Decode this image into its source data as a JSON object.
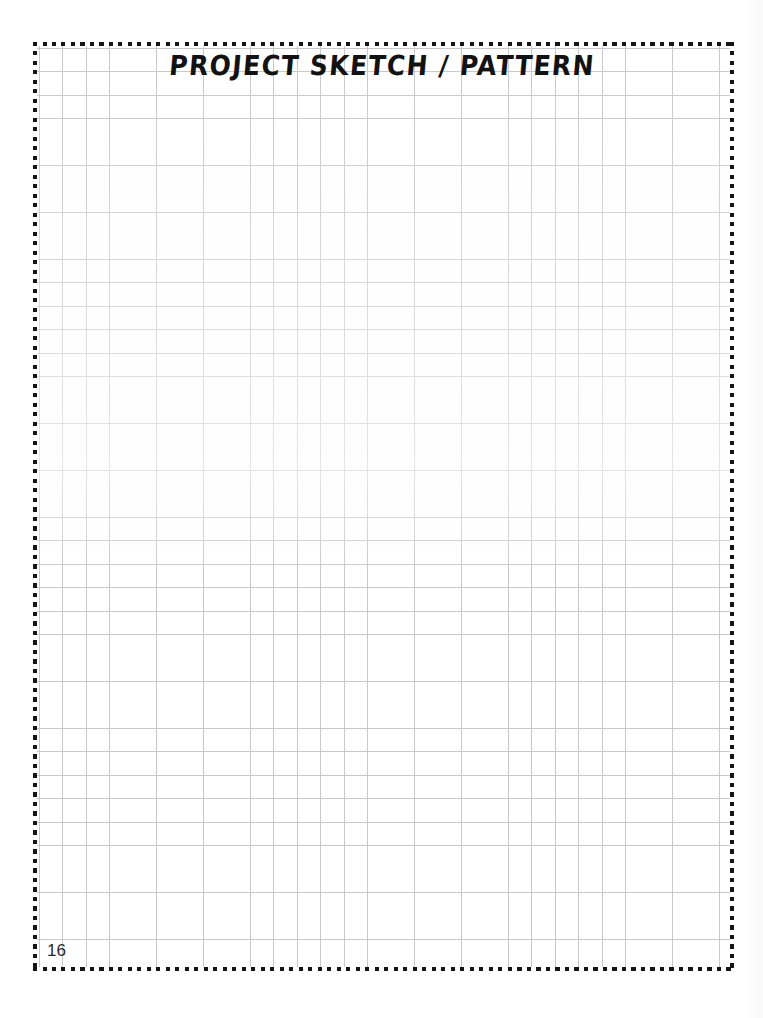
{
  "page": {
    "title": "PROJECT SKETCH / PATTERN",
    "page_number": "16",
    "background_color": "#ffffff",
    "border_style": "dotted",
    "border_color": "#151515",
    "grid": {
      "type": "square-graph-grid",
      "line_color": "#c6c8ca",
      "cell_size_px": 23.45,
      "columns": 29,
      "rows": 39
    }
  }
}
